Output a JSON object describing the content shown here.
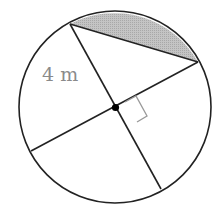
{
  "figure": {
    "type": "geometry-circle",
    "radius_label": "4 m",
    "shaded_region": "circular segment between two perpendicular radii endpoints",
    "right_angle_marker": true,
    "colors": {
      "stroke": "#222222",
      "shade": "#bdbdbd",
      "label": "#8a8a8a",
      "right_angle": "#999999"
    }
  }
}
